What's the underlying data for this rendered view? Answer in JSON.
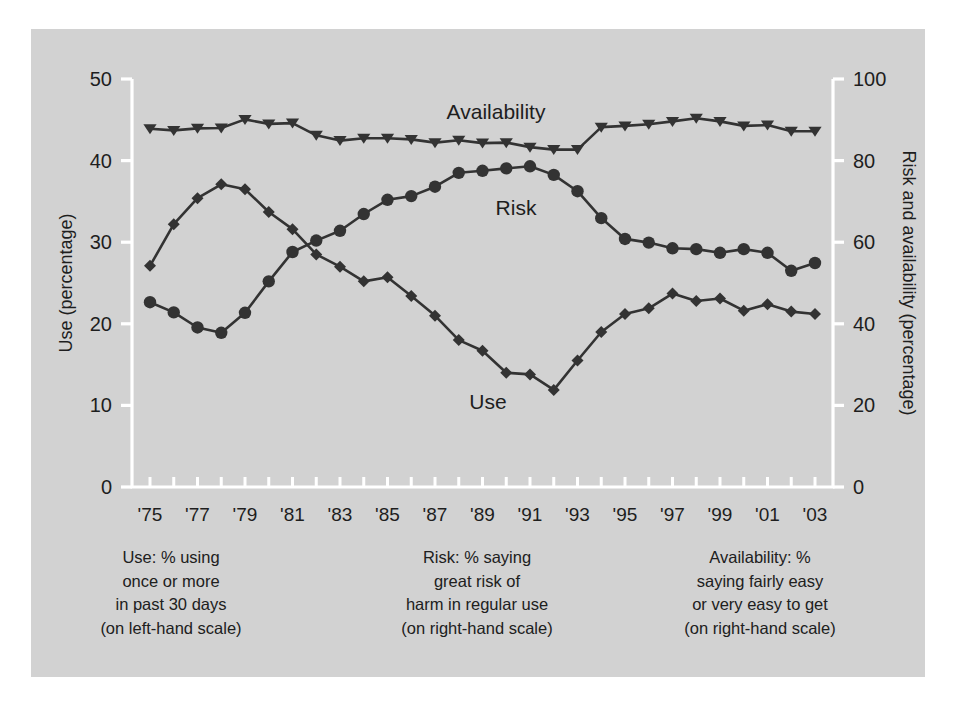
{
  "figure": {
    "background_color": "#d2d2d2",
    "page_color": "#ffffff",
    "series_color": "#333333",
    "axis_color": "#ffffff",
    "text_color": "#1e1e1e"
  },
  "axes": {
    "left_title": "Use (percentage)",
    "right_title": "Risk and availability (percentage)",
    "left_ticks": [
      "0",
      "10",
      "20",
      "30",
      "40",
      "50"
    ],
    "right_ticks": [
      "0",
      "20",
      "40",
      "60",
      "80",
      "100"
    ],
    "x_ticks": [
      "'75",
      "'77",
      "'79",
      "'81",
      "'83",
      "'85",
      "'87",
      "'89",
      "'91",
      "'93",
      "'95",
      "'97",
      "'99",
      "'01",
      "'03"
    ]
  },
  "series_labels": {
    "availability": "Availability",
    "risk": "Risk",
    "use": "Use"
  },
  "captions": {
    "use": "Use: % using\nonce or more\nin past 30 days\n(on left-hand scale)",
    "risk": "Risk: % saying\ngreat risk of\nharm in regular use\n(on right-hand scale)",
    "availability": "Availability: %\nsaying fairly easy\nor very easy to get\n(on right-hand scale)"
  },
  "chart_data": {
    "type": "line",
    "title": "",
    "xlabel": "",
    "ylabel": "Use (percentage)",
    "y2label": "Risk and availability (percentage)",
    "ylim": [
      0,
      50
    ],
    "y2lim": [
      0,
      100
    ],
    "grid": false,
    "legend": "inline-annotations",
    "x": [
      1975,
      1976,
      1977,
      1978,
      1979,
      1980,
      1981,
      1982,
      1983,
      1984,
      1985,
      1986,
      1987,
      1988,
      1989,
      1990,
      1991,
      1992,
      1993,
      1994,
      1995,
      1996,
      1997,
      1998,
      1999,
      2000,
      2001,
      2002,
      2003
    ],
    "x_tick_labels": [
      "'75",
      "'77",
      "'79",
      "'81",
      "'83",
      "'85",
      "'87",
      "'89",
      "'91",
      "'93",
      "'95",
      "'97",
      "'99",
      "'01",
      "'03"
    ],
    "series": [
      {
        "name": "Use",
        "axis": "left",
        "marker": "diamond",
        "unit": "percent",
        "values": [
          27.1,
          32.2,
          35.4,
          37.1,
          36.5,
          33.7,
          31.6,
          28.5,
          27.0,
          25.2,
          25.7,
          23.4,
          21.0,
          18.0,
          16.7,
          14.0,
          13.8,
          11.9,
          15.5,
          19.0,
          21.2,
          21.9,
          23.7,
          22.8,
          23.1,
          21.6,
          22.4,
          21.5,
          21.2
        ]
      },
      {
        "name": "Risk",
        "axis": "right",
        "marker": "circle",
        "unit": "percent",
        "values": [
          45.3,
          42.8,
          39.1,
          37.8,
          42.7,
          50.4,
          57.6,
          60.4,
          62.8,
          66.9,
          70.4,
          71.3,
          73.6,
          77.0,
          77.5,
          78.1,
          78.6,
          76.5,
          72.5,
          65.9,
          60.8,
          59.9,
          58.5,
          58.3,
          57.4,
          58.3,
          57.4,
          53.0,
          54.9
        ]
      },
      {
        "name": "Availability",
        "axis": "right",
        "marker": "triangle-down",
        "unit": "percent",
        "values": [
          87.8,
          87.4,
          87.9,
          88.0,
          90.1,
          89.0,
          89.2,
          86.2,
          84.9,
          85.5,
          85.5,
          85.2,
          84.4,
          85.0,
          84.3,
          84.4,
          83.3,
          82.7,
          82.7,
          88.2,
          88.5,
          88.9,
          89.6,
          90.4,
          89.6,
          88.5,
          88.7,
          87.2,
          87.2
        ]
      }
    ]
  }
}
